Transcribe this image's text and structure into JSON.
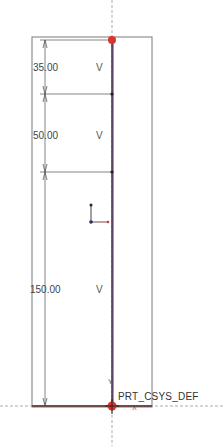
{
  "sketch": {
    "colors": {
      "construction": "#7a7a7a",
      "geometry": "#2b2a5c",
      "highlight": "#c0392b",
      "dimension": "#555555",
      "background": "#ffffff"
    },
    "dimensions": [
      {
        "value": "35.00",
        "constraint": "V"
      },
      {
        "value": "50.00",
        "constraint": "V"
      },
      {
        "value": "150.00",
        "constraint": "V"
      }
    ],
    "coordinate_system": {
      "label": "PRT_CSYS_DEF",
      "y_axis_label": "Y",
      "x_axis_label": "X"
    }
  }
}
